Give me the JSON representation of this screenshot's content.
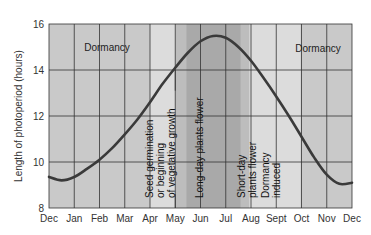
{
  "chart_data": {
    "type": "line",
    "title": "",
    "xlabel": "",
    "ylabel": "Length of photoperiod (hours)",
    "ylim": [
      8,
      16
    ],
    "yticks": [
      8,
      10,
      12,
      14,
      16
    ],
    "grid": true,
    "months": [
      "Dec",
      "Jan",
      "Feb",
      "Mar",
      "Apr",
      "May",
      "Jun",
      "Jul",
      "Aug",
      "Sept",
      "Oct",
      "Nov",
      "Dec"
    ],
    "series": [
      {
        "name": "Photoperiod",
        "x_month_index": [
          0,
          0.5,
          1,
          1.5,
          2,
          2.5,
          3,
          3.5,
          4,
          4.5,
          5,
          5.5,
          6,
          6.5,
          7,
          7.5,
          8,
          8.5,
          9,
          9.5,
          10,
          10.5,
          11,
          11.5,
          12
        ],
        "values": [
          9.35,
          9.2,
          9.35,
          9.7,
          10.1,
          10.6,
          11.2,
          11.85,
          12.6,
          13.4,
          14.1,
          14.75,
          15.25,
          15.48,
          15.4,
          15.0,
          14.4,
          13.65,
          12.85,
          12.0,
          11.1,
          10.2,
          9.45,
          9.05,
          9.1
        ]
      }
    ],
    "bands": [
      {
        "from": 0,
        "to": 4,
        "shade": "#c9c9c9",
        "label": "Dormancy"
      },
      {
        "from": 4,
        "to": 5,
        "shade": "#dcdcdc",
        "label": "Seed germination or beginning of vegetative growth"
      },
      {
        "from": 5,
        "to": 5.43,
        "shade": "#bdbdbd",
        "label": ""
      },
      {
        "from": 5.43,
        "to": 7.6,
        "shade": "#a9a9a9",
        "label": "Long-day plants flower"
      },
      {
        "from": 7.6,
        "to": 7.95,
        "shade": "#bdbdbd",
        "label": ""
      },
      {
        "from": 7.95,
        "to": 8.95,
        "shade": "#dcdcdc",
        "label": "Short-day plants flower"
      },
      {
        "from": 8.95,
        "to": 9.95,
        "shade": "#dcdcdc",
        "label": "Dormancy induced"
      },
      {
        "from": 9.95,
        "to": 12,
        "shade": "#c9c9c9",
        "label": "Dormancy"
      }
    ],
    "annotations": {
      "dormancy_left": "Dormancy",
      "dormancy_right": "Dormancy",
      "seed_line1": "Seed germination",
      "seed_line2": "or beginning",
      "seed_line3": "of vegetative growth",
      "long_day": "Long-day plants flower",
      "short_day_line1": "Short-day",
      "short_day_line2": "plants flower",
      "dormancy_induced_line1": "Dormancy",
      "dormancy_induced_line2": "induced"
    },
    "colors": {
      "curve": "#3a3a3a",
      "grid": "#333333",
      "axis": "#333333"
    }
  }
}
